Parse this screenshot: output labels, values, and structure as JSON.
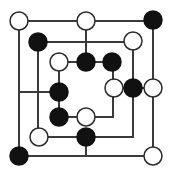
{
  "board": {
    "width": 171,
    "height": 174,
    "background": "#ffffff",
    "line_color": "#3a3a3a",
    "piece_radius": 9,
    "colors": {
      "white": "#ffffff",
      "black": "#111111"
    },
    "lines": [
      [
        19,
        21,
        153,
        21
      ],
      [
        19,
        21,
        19,
        156
      ],
      [
        19,
        156,
        153,
        156
      ],
      [
        153,
        21,
        153,
        156
      ],
      [
        86,
        21,
        86,
        62
      ],
      [
        38,
        42,
        133,
        42
      ],
      [
        38,
        42,
        38,
        137
      ],
      [
        133,
        42,
        133,
        137
      ],
      [
        38,
        137,
        133,
        137
      ],
      [
        86,
        137,
        86,
        156
      ],
      [
        59,
        62,
        113,
        62
      ],
      [
        113,
        62,
        113,
        88
      ],
      [
        59,
        62,
        59,
        117
      ],
      [
        19,
        92,
        59,
        92
      ],
      [
        59,
        117,
        113,
        117
      ],
      [
        113,
        88,
        113,
        117
      ],
      [
        113,
        88,
        153,
        88
      ]
    ],
    "pieces": [
      {
        "x": 19,
        "y": 21,
        "color": "white"
      },
      {
        "x": 86,
        "y": 21,
        "color": "white"
      },
      {
        "x": 153,
        "y": 20,
        "color": "black"
      },
      {
        "x": 38,
        "y": 42,
        "color": "black"
      },
      {
        "x": 133,
        "y": 41,
        "color": "white"
      },
      {
        "x": 59,
        "y": 62,
        "color": "white"
      },
      {
        "x": 86,
        "y": 62,
        "color": "black"
      },
      {
        "x": 112,
        "y": 62,
        "color": "black"
      },
      {
        "x": 59,
        "y": 92,
        "color": "black"
      },
      {
        "x": 114,
        "y": 88,
        "color": "white"
      },
      {
        "x": 133,
        "y": 88,
        "color": "black"
      },
      {
        "x": 153,
        "y": 88,
        "color": "white"
      },
      {
        "x": 59,
        "y": 117,
        "color": "black"
      },
      {
        "x": 86,
        "y": 117,
        "color": "white"
      },
      {
        "x": 39,
        "y": 137,
        "color": "white"
      },
      {
        "x": 86,
        "y": 137,
        "color": "black"
      },
      {
        "x": 19,
        "y": 156,
        "color": "black"
      },
      {
        "x": 153,
        "y": 156,
        "color": "white"
      }
    ],
    "counts": {
      "white": 9,
      "black": 9
    }
  }
}
